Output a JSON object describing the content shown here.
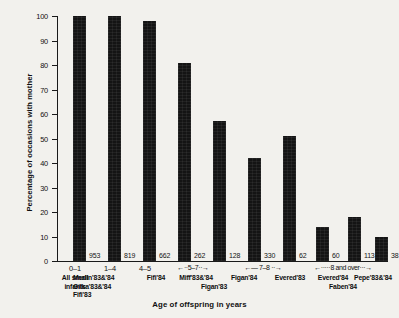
{
  "chart_data": {
    "type": "bar",
    "title": "",
    "xlabel": "Age of offspring in years",
    "ylabel": "Percentage of occasions with mother",
    "ylim": [
      0,
      100
    ],
    "ytick_labels": [
      "100",
      "90",
      "80",
      "70",
      "60",
      "50",
      "40",
      "30",
      "20",
      "10",
      "0"
    ],
    "ytick_values": [
      100,
      90,
      80,
      70,
      60,
      50,
      40,
      30,
      20,
      10,
      0
    ],
    "grid": false,
    "legend": null,
    "categories": [
      "All small infants",
      "Merlin '83&'84 / Gilka '83&'84 / Fifi '83",
      "Fifi '84",
      "Miff '83&'84",
      "Figan '83",
      "Figan '84",
      "Evered '83",
      "Evered '84",
      "Faben '84",
      "Pepe '83&'84"
    ],
    "values": [
      100,
      100,
      98,
      81,
      57,
      42,
      51,
      14,
      18,
      10
    ],
    "sample_sizes": [
      953,
      819,
      662,
      262,
      128,
      330,
      62,
      60,
      113,
      38
    ],
    "bars": [
      {
        "value": 100,
        "n": "953",
        "age_range": "0-1",
        "names": [
          "All small",
          "infants"
        ]
      },
      {
        "value": 100,
        "n": "819",
        "age_range": "1-4",
        "names": [
          "Merlin'83&'84",
          "Gilka'83&'84",
          "Fifi'83"
        ]
      },
      {
        "value": 98,
        "n": "662",
        "age_range": "4-5",
        "names": [
          "Fifi'84"
        ]
      },
      {
        "value": 81,
        "n": "262",
        "age_range": "",
        "names": [
          "Miff'83&'84"
        ]
      },
      {
        "value": 57,
        "n": "128",
        "age_range": "",
        "names": [
          "Figan'83"
        ]
      },
      {
        "value": 42,
        "n": "330",
        "age_range": "",
        "names": [
          "Figan'84"
        ]
      },
      {
        "value": 51,
        "n": "62",
        "age_range": "",
        "names": [
          "Evered'83"
        ]
      },
      {
        "value": 14,
        "n": "60",
        "age_range": "",
        "names": [
          "Evered'84"
        ]
      },
      {
        "value": 18,
        "n": "113",
        "age_range": "",
        "names": [
          "Faben'84"
        ]
      },
      {
        "value": 10,
        "n": "38",
        "age_range": "",
        "names": [
          "Pepe'83&'84"
        ]
      }
    ],
    "age_group_brackets": [
      {
        "label": "0-1",
        "style": "plain"
      },
      {
        "label": "1-4",
        "style": "plain"
      },
      {
        "label": "4-5",
        "style": "plain"
      },
      {
        "label": "5-7",
        "style": "arrows"
      },
      {
        "label": "7-8",
        "style": "arrows"
      },
      {
        "label": "8 and over",
        "style": "arrows"
      }
    ],
    "annotations": []
  },
  "ticks": {
    "t100": "100",
    "t90": "90",
    "t80": "80",
    "t70": "70",
    "t60": "60",
    "t50": "50",
    "t40": "40",
    "t30": "30",
    "t20": "20",
    "t10": "10",
    "t0": "0"
  },
  "axis_titles": {
    "y": "Percentage of occasions with mother",
    "x": "Age of offspring in years"
  },
  "bar_counts": {
    "b0": "953",
    "b1": "819",
    "b2": "662",
    "b3": "262",
    "b4": "128",
    "b5": "330",
    "b6": "62",
    "b7": "60",
    "b8": "113",
    "b9": "38"
  },
  "group_labels": {
    "g0": "0–1",
    "g1": "1–4",
    "g2": "4–5",
    "g3": "←··5–7··→",
    "g4": "←— 7–8 ··→",
    "g5": "←·····8 and over···→"
  },
  "name_labels": {
    "n0_l1": "All small",
    "n0_l2": "infants",
    "n1_l1": "Merlin'83&'84",
    "n1_l2": "Gilka'83&'84",
    "n1_l3": "Fifi'83",
    "n2_l1": "Fifi'84",
    "n3_l1": "Miff'83&'84",
    "n4_l1": "Figan'83",
    "n5_l1": "Figan'84",
    "n6_l1": "Evered'83",
    "n7_l1": "Evered'84",
    "n8_l1": "Faben'84",
    "n9_l1": "Pepe'83&'84"
  },
  "colors": {
    "bar": "#141414",
    "axis": "#1a1a1a",
    "text": "#101010",
    "background": "#f2f1ed"
  }
}
